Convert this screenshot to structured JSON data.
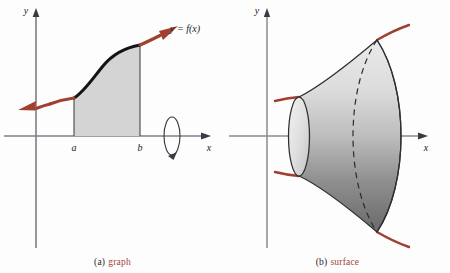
{
  "figure": {
    "background_color": "#fdfdfd",
    "width": 450,
    "height": 273
  },
  "panels": [
    {
      "id": "graph",
      "caption_tag": "(a)",
      "caption_word": "graph",
      "axis_x_label": "x",
      "axis_y_label": "y",
      "tick_labels": [
        "a",
        "b"
      ],
      "curve_label": "y = f(x)",
      "region_fill_color": "#d4d4d4",
      "curve_color": "#1b1b1b",
      "arrow_color": "#a0402f",
      "axis_color": "#5a5a62",
      "rotation_indicator": "revolution-arrow"
    },
    {
      "id": "surface",
      "caption_tag": "(b)",
      "caption_word": "surface",
      "axis_x_label": "x",
      "axis_y_label": "y",
      "surface_light_color": "#efefef",
      "surface_dark_color": "#6e6e6e",
      "outline_color": "#2a2a2a",
      "hidden_edge_style": "dashed",
      "curve_color": "#a0402f",
      "axis_color": "#5a5a62"
    }
  ],
  "colors": {
    "accent_red": "#a0402f",
    "caption_red": "#9d4535",
    "ink": "#1a1a24",
    "axis_gray": "#5a5a62",
    "shade_gray": "#d4d4d4"
  }
}
